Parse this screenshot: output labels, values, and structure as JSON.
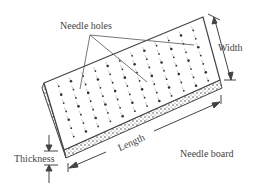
{
  "diagram": {
    "title": "Needle board",
    "labels": {
      "needle_holes": "Needle holes",
      "width": "Width",
      "length": "Length",
      "thickness": "Thickness",
      "needle_board": "Needle board"
    },
    "colors": {
      "line": "#444444",
      "dot": "#333333",
      "texture": "#888888"
    }
  }
}
